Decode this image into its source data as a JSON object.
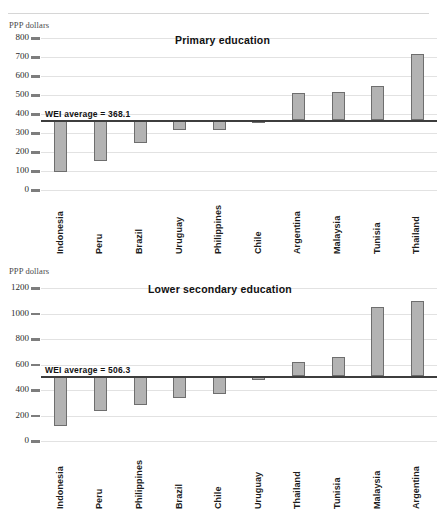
{
  "page": {
    "cut_header_text": "",
    "axis_unit_label": "PPP dollars"
  },
  "chart_data": [
    {
      "id": "primary",
      "type": "bar",
      "title": "Primary education",
      "ylabel": "PPP dollars",
      "xlabel": "",
      "ylim": [
        0,
        800
      ],
      "ytick_step": 100,
      "ticks": [
        "800",
        "700",
        "600",
        "500",
        "400",
        "300",
        "200",
        "100",
        "0"
      ],
      "grid": true,
      "reference_line": {
        "label": "WEI average =  368.1",
        "value": 368.1
      },
      "categories": [
        "Indonesia",
        "Peru",
        "Brazil",
        "Uruguay",
        "Philippines",
        "Chile",
        "Argentina",
        "Malaysia",
        "Tunisia",
        "Thailand"
      ],
      "values": [
        95,
        155,
        248,
        315,
        318,
        350,
        512,
        518,
        548,
        718
      ]
    },
    {
      "id": "lower_secondary",
      "type": "bar",
      "title": "Lower secondary education",
      "ylabel": "PPP dollars",
      "xlabel": "",
      "ylim": [
        0,
        1200
      ],
      "ytick_step": 200,
      "ticks": [
        "1200",
        "1000",
        "800",
        "600",
        "400",
        "200",
        "0"
      ],
      "grid": true,
      "reference_line": {
        "label": "WEI average = 506.3",
        "value": 506.3
      },
      "categories": [
        "Indonesia",
        "Peru",
        "Philippines",
        "Brazil",
        "Chile",
        "Uruguay",
        "Thailand",
        "Tunisia",
        "Malaysia",
        "Argentina"
      ],
      "values": [
        120,
        235,
        285,
        340,
        365,
        480,
        620,
        655,
        1050,
        1100
      ]
    }
  ],
  "colors": {
    "bar_fill": "#b3b3b3",
    "bar_border": "#6e6e6e",
    "grid": "#e2e2e2",
    "average_line": "#3d3d3d",
    "text": "#111111"
  }
}
